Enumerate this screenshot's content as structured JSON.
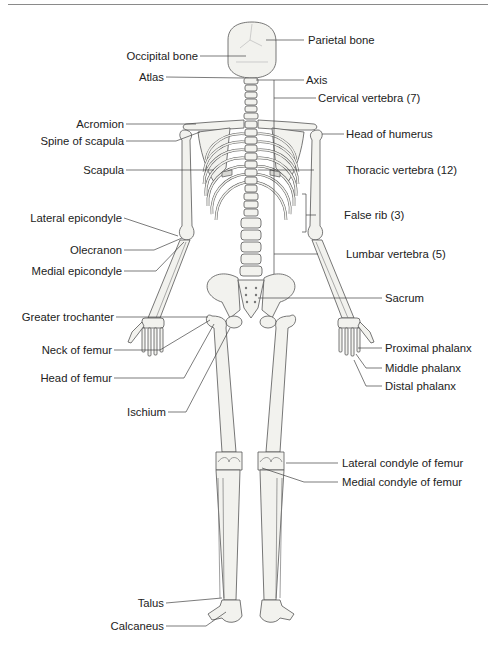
{
  "diagram": {
    "labels_left": [
      {
        "id": "occipital-bone",
        "text": "Occipital bone"
      },
      {
        "id": "atlas",
        "text": "Atlas"
      },
      {
        "id": "acromion",
        "text": "Acromion"
      },
      {
        "id": "spine-of-scapula",
        "text": "Spine of scapula"
      },
      {
        "id": "scapula",
        "text": "Scapula"
      },
      {
        "id": "lateral-epicondyle",
        "text": "Lateral epicondyle"
      },
      {
        "id": "olecranon",
        "text": "Olecranon"
      },
      {
        "id": "medial-epicondyle",
        "text": "Medial epicondyle"
      },
      {
        "id": "greater-trochanter",
        "text": "Greater trochanter"
      },
      {
        "id": "neck-of-femur",
        "text": "Neck of femur"
      },
      {
        "id": "head-of-femur",
        "text": "Head of femur"
      },
      {
        "id": "ischium",
        "text": "Ischium"
      },
      {
        "id": "talus",
        "text": "Talus"
      },
      {
        "id": "calcaneus",
        "text": "Calcaneus"
      }
    ],
    "labels_right": [
      {
        "id": "parietal-bone",
        "text": "Parietal bone"
      },
      {
        "id": "axis",
        "text": "Axis"
      },
      {
        "id": "cervical-vertebra",
        "text": "Cervical vertebra (7)"
      },
      {
        "id": "head-of-humerus",
        "text": "Head of humerus"
      },
      {
        "id": "thoracic-vertebra",
        "text": "Thoracic vertebra (12)"
      },
      {
        "id": "false-rib",
        "text": "False rib (3)"
      },
      {
        "id": "lumbar-vertebra",
        "text": "Lumbar vertebra (5)"
      },
      {
        "id": "sacrum",
        "text": "Sacrum"
      },
      {
        "id": "proximal-phalanx",
        "text": "Proximal phalanx"
      },
      {
        "id": "middle-phalanx",
        "text": "Middle phalanx"
      },
      {
        "id": "distal-phalanx",
        "text": "Distal phalanx"
      },
      {
        "id": "lateral-condyle-of-femur",
        "text": "Lateral condyle of femur"
      },
      {
        "id": "medial-condyle-of-femur",
        "text": "Medial condyle of femur"
      }
    ]
  }
}
